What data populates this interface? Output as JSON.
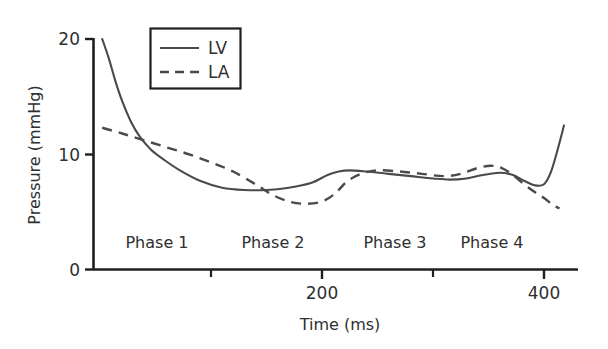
{
  "chart_data": {
    "type": "line",
    "title": "",
    "xlabel": "Time (ms)",
    "ylabel": "Pressure (mmHg)",
    "xlim": [
      0,
      420
    ],
    "ylim": [
      0,
      20
    ],
    "xticks": [
      200,
      400
    ],
    "xtick_labels": [
      "200",
      "400"
    ],
    "xminor_ticks": [
      100,
      300
    ],
    "yticks": [
      0,
      10,
      20
    ],
    "ytick_labels": [
      "0",
      "10",
      "20"
    ],
    "grid": false,
    "legend_position": "top-center",
    "legend_box": true,
    "series": [
      {
        "name": "LV",
        "style": "solid",
        "color": "#4a4a4a",
        "x": [
          2,
          8,
          14,
          20,
          28,
          36,
          46,
          58,
          72,
          90,
          110,
          130,
          150,
          170,
          190,
          205,
          215,
          225,
          240,
          260,
          280,
          300,
          315,
          330,
          345,
          360,
          372,
          382,
          392,
          400,
          406,
          412,
          418
        ],
        "y": [
          20.0,
          18.3,
          16.3,
          14.6,
          12.8,
          11.5,
          10.4,
          9.5,
          8.6,
          7.7,
          7.1,
          6.9,
          6.9,
          7.1,
          7.5,
          8.2,
          8.5,
          8.6,
          8.5,
          8.3,
          8.1,
          7.9,
          7.8,
          7.9,
          8.2,
          8.4,
          8.2,
          7.7,
          7.3,
          7.4,
          8.4,
          10.3,
          12.5
        ]
      },
      {
        "name": "LA",
        "style": "dashed",
        "color": "#4a4a4a",
        "x": [
          2,
          20,
          40,
          60,
          80,
          100,
          120,
          140,
          155,
          170,
          185,
          200,
          212,
          222,
          235,
          250,
          270,
          290,
          310,
          325,
          340,
          352,
          362,
          372,
          382,
          392,
          400,
          408,
          414
        ],
        "y": [
          12.3,
          11.8,
          11.2,
          10.6,
          10.0,
          9.3,
          8.5,
          7.4,
          6.5,
          5.9,
          5.7,
          5.9,
          6.6,
          7.6,
          8.3,
          8.6,
          8.5,
          8.3,
          8.1,
          8.3,
          8.8,
          9.0,
          8.8,
          8.2,
          7.4,
          6.7,
          6.2,
          5.6,
          5.3
        ]
      }
    ],
    "annotations": [
      {
        "text": "Phase 1",
        "x": 100,
        "y": 3.0
      },
      {
        "text": "Phase 2",
        "x": 205,
        "y": 3.0
      },
      {
        "text": "Phase 3",
        "x": 315,
        "y": 3.0
      },
      {
        "text": "Phase 4",
        "x": 400,
        "y": 3.0
      }
    ]
  },
  "axes": {
    "y_title": "Pressure (mmHg)",
    "x_title": "Time (ms)",
    "y_tick_0": "0",
    "y_tick_10": "10",
    "y_tick_20": "20",
    "x_tick_200": "200",
    "x_tick_400": "400"
  },
  "legend": {
    "entries": [
      {
        "label": "LV",
        "style": "solid"
      },
      {
        "label": "LA",
        "style": "dashed"
      }
    ],
    "lv_label": "LV",
    "la_label": "LA"
  },
  "phases": {
    "phase1": "Phase 1",
    "phase2": "Phase 2",
    "phase3": "Phase 3",
    "phase4": "Phase 4"
  },
  "colors": {
    "line": "#4a4a4a",
    "axis": "#1f1f1f",
    "text": "#2f2f2f",
    "background": "#ffffff"
  }
}
